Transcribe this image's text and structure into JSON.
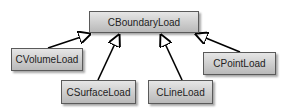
{
  "diagram": {
    "type": "uml-class-inheritance",
    "parent": {
      "label": "CBoundaryLoad"
    },
    "children": [
      {
        "label": "CVolumeLoad"
      },
      {
        "label": "CSurfaceLoad"
      },
      {
        "label": "CLineLoad"
      },
      {
        "label": "CPointLoad"
      }
    ],
    "relation": "generalization",
    "colors": {
      "box_fill": "#cfcfcf",
      "box_border": "#5a5a5a",
      "arrow": "#000000",
      "text": "#222222"
    }
  }
}
